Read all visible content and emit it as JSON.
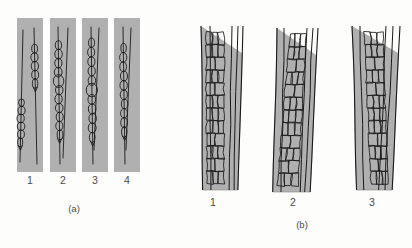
{
  "figure": {
    "background_color": "#fdfdfc",
    "band_fill_color": "#b0b0b0",
    "band_stroke_color": "#8f8f8f",
    "ink_color": "#1a1a1a",
    "label_color": "#4a4a4a",
    "panels": [
      {
        "caption": "(a)",
        "caption_x": 74,
        "caption_y": 212,
        "label_y": 184,
        "description": "strips with hyphal cell chains",
        "items": [
          {
            "label": "1",
            "label_x": 30,
            "rect": {
              "x": 17,
              "y": 18,
              "w": 26,
              "h": 154
            },
            "strands": [
              {
                "top_x": 23,
                "top_y": 30,
                "bot_x": 20,
                "bot_y": 162,
                "chain_start": 0.52,
                "chain_end": 0.88,
                "cells": 6,
                "cell_w": 7.0,
                "bulge_at": -1
              },
              {
                "top_x": 34,
                "top_y": 28,
                "bot_x": 37,
                "bot_y": 164,
                "chain_start": 0.12,
                "chain_end": 0.44,
                "cells": 5,
                "cell_w": 7.0,
                "bulge_at": -1
              }
            ]
          },
          {
            "label": "2",
            "label_x": 63,
            "rect": {
              "x": 50,
              "y": 18,
              "w": 26,
              "h": 154
            },
            "strands": [
              {
                "top_x": 58,
                "top_y": 27,
                "bot_x": 60,
                "bot_y": 164,
                "chain_start": 0.1,
                "chain_end": 0.82,
                "cells": 11,
                "cell_w": 7.5,
                "bulge_at": 4
              },
              {
                "top_x": 68,
                "top_y": 28,
                "bot_x": 63,
                "bot_y": 158,
                "chain_start": 0.0,
                "chain_end": 0.0,
                "cells": 0,
                "cell_w": 7.0,
                "bulge_at": -1
              }
            ]
          },
          {
            "label": "3",
            "label_x": 95,
            "rect": {
              "x": 82,
              "y": 18,
              "w": 26,
              "h": 154
            },
            "strands": [
              {
                "top_x": 91,
                "top_y": 27,
                "bot_x": 93,
                "bot_y": 164,
                "chain_start": 0.08,
                "chain_end": 0.84,
                "cells": 11,
                "cell_w": 7.5,
                "bulge_at": 5
              },
              {
                "top_x": 99,
                "top_y": 28,
                "bot_x": 94,
                "bot_y": 150,
                "chain_start": 0.0,
                "chain_end": 0.0,
                "cells": 0,
                "cell_w": 7.0,
                "bulge_at": -1
              }
            ]
          },
          {
            "label": "4",
            "label_x": 127,
            "rect": {
              "x": 114,
              "y": 18,
              "w": 26,
              "h": 154
            },
            "strands": [
              {
                "top_x": 123,
                "top_y": 27,
                "bot_x": 125,
                "bot_y": 164,
                "chain_start": 0.12,
                "chain_end": 0.8,
                "cells": 10,
                "cell_w": 7.0,
                "bulge_at": -1
              },
              {
                "top_x": 131,
                "top_y": 28,
                "bot_x": 126,
                "bot_y": 150,
                "chain_start": 0.0,
                "chain_end": 0.0,
                "cells": 0,
                "cell_w": 7.0,
                "bulge_at": -1
              }
            ]
          }
        ]
      },
      {
        "caption": "(b)",
        "caption_x": 302,
        "caption_y": 228,
        "label_y": 206,
        "description": "bands with polygonal parenchyma cells",
        "items": [
          {
            "label": "1",
            "label_x": 213,
            "band": {
              "top_left": 201,
              "top_right": 243,
              "bot_left": 203,
              "bot_right": 238,
              "top_y": 26,
              "bot_y": 190
            },
            "veins": [
              {
                "top_x": 210,
                "bot_x": 211
              },
              {
                "top_x": 232,
                "bot_x": 229
              },
              {
                "top_x": 238,
                "bot_x": 234
              }
            ],
            "tissue": {
              "left_top": 206,
              "right_top": 224,
              "left_bot": 207,
              "right_bot": 224,
              "rows": 12,
              "cols": 3
            }
          },
          {
            "label": "2",
            "label_x": 293,
            "band": {
              "top_left": 277,
              "top_right": 318,
              "bot_left": 273,
              "bot_right": 310,
              "top_y": 28,
              "bot_y": 192
            },
            "veins": [
              {
                "top_x": 284,
                "bot_x": 281
              },
              {
                "top_x": 307,
                "bot_x": 300
              },
              {
                "top_x": 313,
                "bot_x": 305
              }
            ],
            "tissue": {
              "left_top": 290,
              "right_top": 306,
              "left_bot": 277,
              "right_bot": 298,
              "rows": 12,
              "cols": 3
            }
          },
          {
            "label": "3",
            "label_x": 372,
            "band": {
              "top_left": 352,
              "top_right": 400,
              "bot_left": 357,
              "bot_right": 392,
              "top_y": 26,
              "bot_y": 190
            },
            "veins": [
              {
                "top_x": 360,
                "bot_x": 364
              },
              {
                "top_x": 386,
                "bot_x": 379
              },
              {
                "top_x": 393,
                "bot_x": 385
              }
            ],
            "tissue": {
              "left_top": 364,
              "right_top": 383,
              "left_bot": 371,
              "right_bot": 388,
              "rows": 12,
              "cols": 3
            }
          }
        ]
      }
    ]
  }
}
